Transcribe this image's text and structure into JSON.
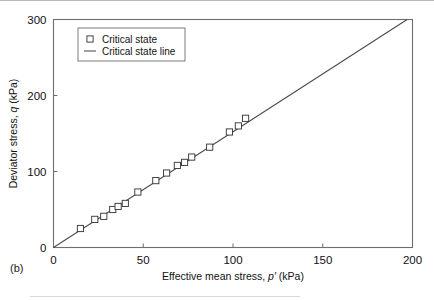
{
  "figure": {
    "panel_label": "(b)",
    "background": "#ffffff",
    "axis_color": "#6e6e6e",
    "line_color": "#4a4a4a",
    "marker_color": "#ffffff",
    "marker_stroke": "#3a3a3a"
  },
  "chart_data": {
    "type": "scatter",
    "title": "",
    "xlabel_parts": {
      "pre": "Effective mean stress, ",
      "sym": "p′",
      "post": " (kPa)"
    },
    "ylabel_parts": {
      "pre": "Deviator stress, ",
      "sym": "q",
      "post": " (kPa)"
    },
    "xlabel": "Effective mean stress, p′ (kPa)",
    "ylabel": "Deviator stress, q (kPa)",
    "xlim": [
      0,
      200
    ],
    "ylim": [
      0,
      300
    ],
    "xticks": [
      0,
      50,
      100,
      150,
      200
    ],
    "xticklabels": [
      "0",
      "50",
      "100",
      "150",
      "200"
    ],
    "yticks": [
      0,
      100,
      200,
      300
    ],
    "yticklabels": [
      "0",
      "100",
      "200",
      "300"
    ],
    "grid": false,
    "legend_position": "upper left",
    "series": [
      {
        "name": "Critical state",
        "type": "scatter",
        "marker": "square-open",
        "x": [
          15,
          23,
          28,
          33,
          36,
          40,
          47,
          57,
          63,
          69,
          73,
          77,
          87,
          98,
          103,
          107
        ],
        "y": [
          25,
          37,
          41,
          50,
          54,
          58,
          73,
          88,
          98,
          108,
          112,
          119,
          132,
          152,
          160,
          170
        ]
      },
      {
        "name": "Critical state line",
        "type": "line",
        "slope": 1.55,
        "intercept": 0,
        "x": [
          0,
          197
        ],
        "y": [
          0,
          305
        ]
      }
    ],
    "legend": [
      {
        "label": "Critical state",
        "marker": "square-open"
      },
      {
        "label": "Critical state line",
        "marker": "line"
      }
    ]
  }
}
